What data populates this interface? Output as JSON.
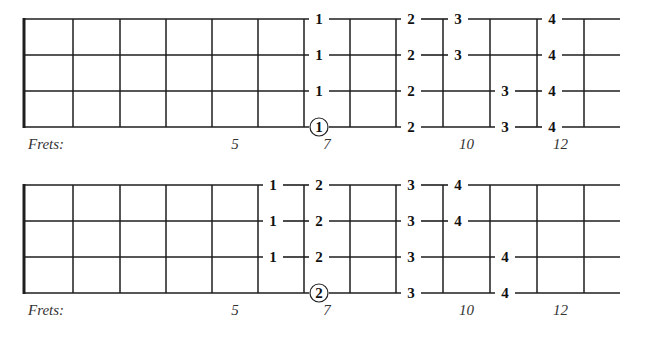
{
  "diagrams": [
    {
      "id": "diagram-1",
      "frets_label": "Frets:",
      "fret_numbers": [
        {
          "label": "5",
          "fret": 5
        },
        {
          "label": "7",
          "fret": 7
        },
        {
          "label": "10",
          "fret": 10
        },
        {
          "label": "12",
          "fret": 12
        }
      ],
      "fingerings": [
        {
          "string": 1,
          "fret": 6,
          "finger": "1",
          "circled": false
        },
        {
          "string": 2,
          "fret": 6,
          "finger": "1",
          "circled": false
        },
        {
          "string": 3,
          "fret": 6,
          "finger": "1",
          "circled": false
        },
        {
          "string": 4,
          "fret": 6,
          "finger": "1",
          "circled": true
        },
        {
          "string": 1,
          "fret": 8,
          "finger": "2",
          "circled": false
        },
        {
          "string": 2,
          "fret": 8,
          "finger": "2",
          "circled": false
        },
        {
          "string": 3,
          "fret": 8,
          "finger": "2",
          "circled": false
        },
        {
          "string": 4,
          "fret": 8,
          "finger": "2",
          "circled": false
        },
        {
          "string": 1,
          "fret": 9,
          "finger": "3",
          "circled": false
        },
        {
          "string": 2,
          "fret": 9,
          "finger": "3",
          "circled": false
        },
        {
          "string": 3,
          "fret": 10,
          "finger": "3",
          "circled": false
        },
        {
          "string": 4,
          "fret": 10,
          "finger": "3",
          "circled": false
        },
        {
          "string": 1,
          "fret": 11,
          "finger": "4",
          "circled": false
        },
        {
          "string": 2,
          "fret": 11,
          "finger": "4",
          "circled": false
        },
        {
          "string": 3,
          "fret": 11,
          "finger": "4",
          "circled": false
        },
        {
          "string": 4,
          "fret": 11,
          "finger": "4",
          "circled": false
        }
      ]
    },
    {
      "id": "diagram-2",
      "frets_label": "Frets:",
      "fret_numbers": [
        {
          "label": "5",
          "fret": 5
        },
        {
          "label": "7",
          "fret": 7
        },
        {
          "label": "10",
          "fret": 10
        },
        {
          "label": "12",
          "fret": 12
        }
      ],
      "fingerings": [
        {
          "string": 1,
          "fret": 5,
          "finger": "1",
          "circled": false
        },
        {
          "string": 2,
          "fret": 5,
          "finger": "1",
          "circled": false
        },
        {
          "string": 3,
          "fret": 5,
          "finger": "1",
          "circled": false
        },
        {
          "string": 1,
          "fret": 6,
          "finger": "2",
          "circled": false
        },
        {
          "string": 2,
          "fret": 6,
          "finger": "2",
          "circled": false
        },
        {
          "string": 3,
          "fret": 6,
          "finger": "2",
          "circled": false
        },
        {
          "string": 4,
          "fret": 6,
          "finger": "2",
          "circled": true
        },
        {
          "string": 1,
          "fret": 8,
          "finger": "3",
          "circled": false
        },
        {
          "string": 2,
          "fret": 8,
          "finger": "3",
          "circled": false
        },
        {
          "string": 3,
          "fret": 8,
          "finger": "3",
          "circled": false
        },
        {
          "string": 4,
          "fret": 8,
          "finger": "3",
          "circled": false
        },
        {
          "string": 1,
          "fret": 9,
          "finger": "4",
          "circled": false
        },
        {
          "string": 2,
          "fret": 9,
          "finger": "4",
          "circled": false
        },
        {
          "string": 3,
          "fret": 10,
          "finger": "4",
          "circled": false
        },
        {
          "string": 4,
          "fret": 10,
          "finger": "4",
          "circled": false
        }
      ]
    }
  ],
  "layout": {
    "nut_x": 24,
    "fret_x": [
      24,
      73,
      120,
      166,
      212,
      258,
      304,
      350,
      396,
      443,
      490,
      537,
      584
    ],
    "end_x": 620,
    "diagram_tops": [
      19,
      185
    ],
    "string_spacing": 36,
    "label_offset": 21
  }
}
